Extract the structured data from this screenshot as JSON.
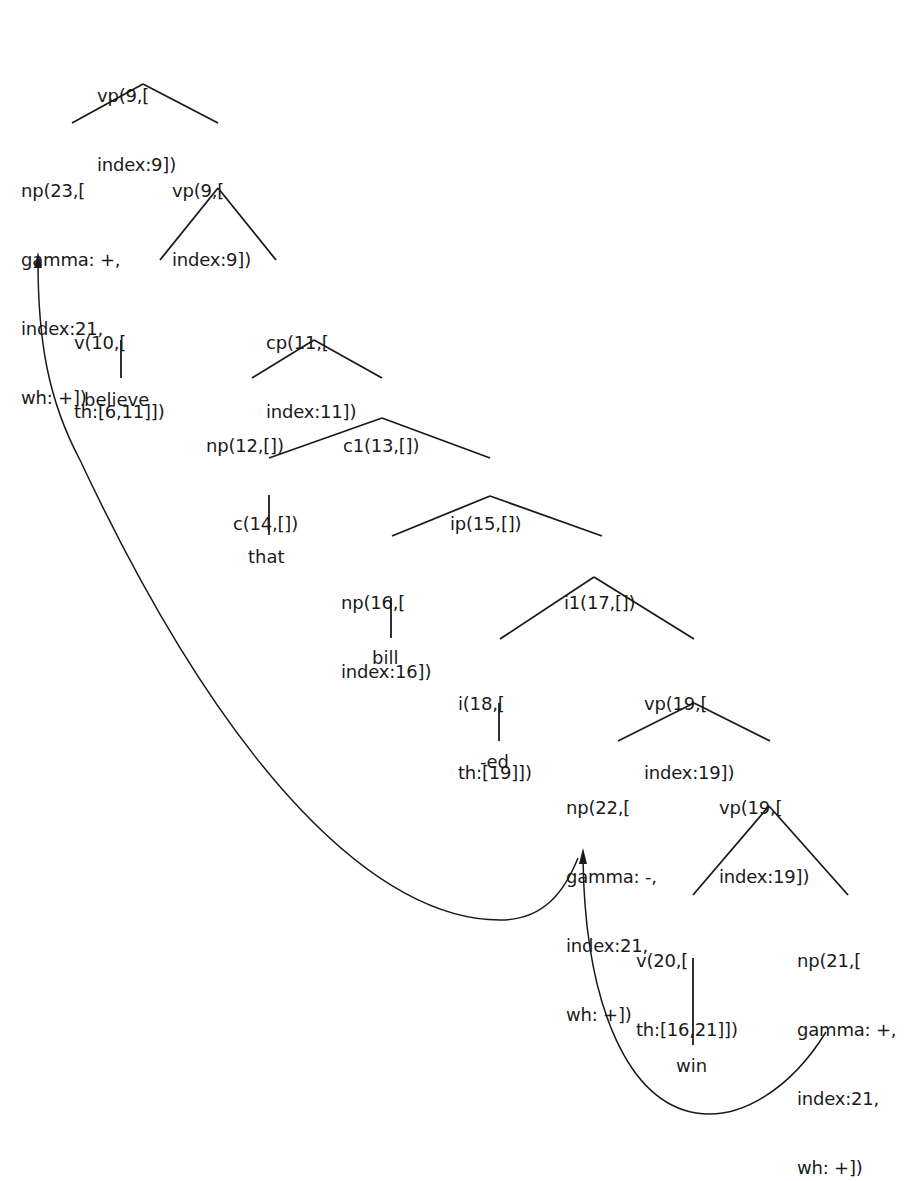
{
  "diagram": {
    "type": "syntax-tree",
    "nodes": {
      "root_vp9": {
        "lines": [
          "vp(9,[",
          "index:9])"
        ]
      },
      "np23": {
        "lines": [
          "np(23,[",
          "gamma: +,",
          "index:21,",
          "wh: +])"
        ]
      },
      "vp9": {
        "lines": [
          "vp(9,[",
          "index:9])"
        ]
      },
      "v10": {
        "lines": [
          "v(10,[",
          "th:[6,11]])"
        ]
      },
      "cp11": {
        "lines": [
          "cp(11,[",
          "index:11])"
        ]
      },
      "np12": {
        "lines": [
          "np(12,[])"
        ]
      },
      "c1_13": {
        "lines": [
          "c1(13,[])"
        ]
      },
      "c14": {
        "lines": [
          "c(14,[])"
        ]
      },
      "ip15": {
        "lines": [
          "ip(15,[])"
        ]
      },
      "np16": {
        "lines": [
          "np(16,[",
          "index:16])"
        ]
      },
      "i1_17": {
        "lines": [
          "i1(17,[])"
        ]
      },
      "i18": {
        "lines": [
          "i(18,[",
          "th:[19]])"
        ]
      },
      "vp19": {
        "lines": [
          "vp(19,[",
          "index:19])"
        ]
      },
      "np22": {
        "lines": [
          "np(22,[",
          "gamma: -,",
          "index:21,",
          "wh: +])"
        ]
      },
      "vp19b": {
        "lines": [
          "vp(19,[",
          "index:19])"
        ]
      },
      "v20": {
        "lines": [
          "v(20,[",
          "th:[16,21]])"
        ]
      },
      "np21": {
        "lines": [
          "np(21,[",
          "gamma: +,",
          "index:21,",
          "wh: +])"
        ]
      }
    },
    "leaves": {
      "believe": "believe",
      "that": "that",
      "bill": "bill",
      "ed": "-ed",
      "win": "win"
    },
    "movement_arrows": [
      {
        "from": "np21",
        "to": "np22"
      },
      {
        "from": "np22",
        "to": "np23"
      }
    ]
  }
}
